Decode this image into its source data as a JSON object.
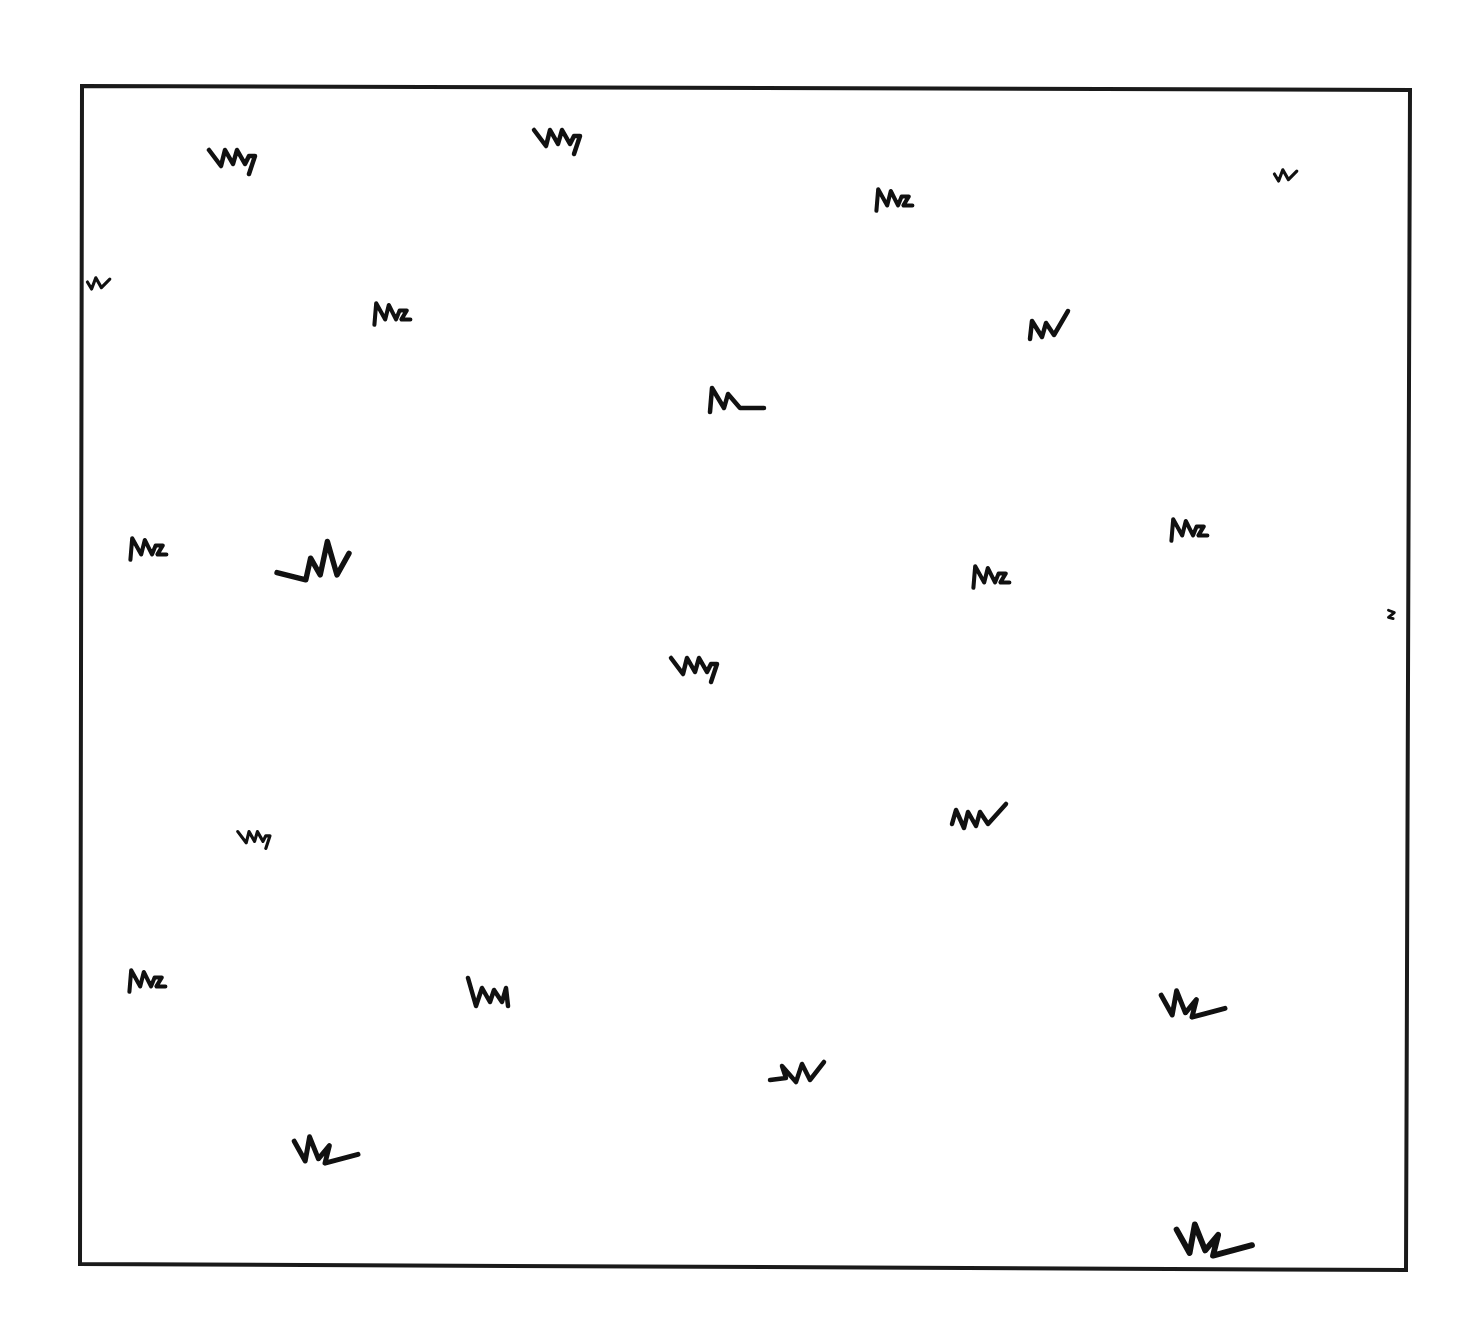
{
  "map": {
    "type": "hand-drawn field map",
    "background_color": "#ffffff",
    "ink_color": "#111111",
    "border": {
      "corners": [
        [
          82,
          86
        ],
        [
          1410,
          90
        ],
        [
          1406,
          1270
        ],
        [
          80,
          1264
        ]
      ]
    },
    "legend": null,
    "grass_tufts": [
      {
        "x": 235,
        "y": 162,
        "variant": "Mh",
        "scale": 1.0
      },
      {
        "x": 560,
        "y": 142,
        "variant": "Mh",
        "scale": 1.0
      },
      {
        "x": 898,
        "y": 200,
        "variant": "Mz",
        "scale": 0.9
      },
      {
        "x": 1287,
        "y": 174,
        "variant": "N",
        "scale": 0.7
      },
      {
        "x": 100,
        "y": 282,
        "variant": "N",
        "scale": 0.7
      },
      {
        "x": 396,
        "y": 314,
        "variant": "Mz",
        "scale": 0.9
      },
      {
        "x": 1050,
        "y": 325,
        "variant": "NV",
        "scale": 1.0
      },
      {
        "x": 736,
        "y": 400,
        "variant": "ML",
        "scale": 1.0
      },
      {
        "x": 152,
        "y": 549,
        "variant": "Mz",
        "scale": 0.9
      },
      {
        "x": 325,
        "y": 563,
        "variant": "WV",
        "scale": 1.2
      },
      {
        "x": 1193,
        "y": 530,
        "variant": "Mz",
        "scale": 0.9
      },
      {
        "x": 995,
        "y": 577,
        "variant": "Mz",
        "scale": 0.9
      },
      {
        "x": 1392,
        "y": 615,
        "variant": "S",
        "scale": 0.6
      },
      {
        "x": 697,
        "y": 670,
        "variant": "Mh",
        "scale": 1.0
      },
      {
        "x": 256,
        "y": 840,
        "variant": "Mh",
        "scale": 0.7
      },
      {
        "x": 980,
        "y": 816,
        "variant": "MV",
        "scale": 1.0
      },
      {
        "x": 151,
        "y": 981,
        "variant": "Mz",
        "scale": 0.9
      },
      {
        "x": 490,
        "y": 994,
        "variant": "Wm",
        "scale": 1.0
      },
      {
        "x": 1192,
        "y": 1004,
        "variant": "VL",
        "scale": 1.1
      },
      {
        "x": 800,
        "y": 1072,
        "variant": "SM",
        "scale": 1.0
      },
      {
        "x": 325,
        "y": 1150,
        "variant": "VL",
        "scale": 1.1
      },
      {
        "x": 1213,
        "y": 1240,
        "variant": "VL",
        "scale": 1.3
      }
    ]
  }
}
